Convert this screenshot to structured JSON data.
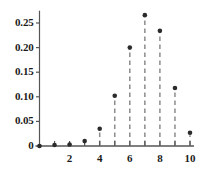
{
  "chart_data": {
    "type": "scatter",
    "title": "",
    "subtitle": "",
    "xlabel": "",
    "ylabel": "",
    "grid": false,
    "legend": false,
    "legend_position": "none",
    "marker": "filled-circle",
    "stems": true,
    "stem_style": "dashed",
    "x": [
      0,
      1,
      2,
      3,
      4,
      5,
      6,
      7,
      8,
      9,
      10
    ],
    "values": [
      0.0,
      0.002,
      0.003,
      0.01,
      0.035,
      0.102,
      0.2,
      0.266,
      0.234,
      0.118,
      0.027
    ],
    "xlim": [
      -0.35,
      10.6
    ],
    "ylim": [
      0,
      0.285
    ],
    "xticks": [
      0,
      1,
      2,
      3,
      4,
      5,
      6,
      7,
      8,
      9,
      10
    ],
    "xtick_labels": [
      "",
      "",
      "2",
      "",
      "4",
      "",
      "6",
      "",
      "8",
      "",
      "10"
    ],
    "yticks": [
      0,
      0.05,
      0.1,
      0.15,
      0.2,
      0.25
    ],
    "ytick_labels": [
      "0",
      "0.05",
      "0.10",
      "0.15",
      "0.20",
      "0.25"
    ],
    "colors": {
      "marker": "#2b2b2b",
      "stem": "#8c8c8c",
      "axis": "#555555",
      "text": "#1a1a1a",
      "background": "#ffffff"
    }
  }
}
